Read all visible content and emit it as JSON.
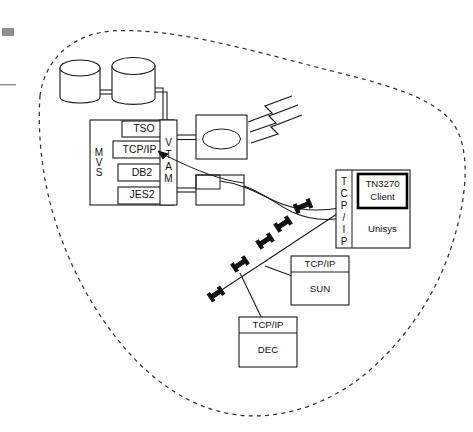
{
  "diagram": {
    "type": "network-architecture-diagram",
    "boundary": {
      "name": "enterprise-network-boundary",
      "style": "dashed-cloud"
    },
    "mainframe": {
      "os_label": "MVS",
      "access_method_label": "VTAM",
      "subsystems": [
        {
          "label": "TSO"
        },
        {
          "label": "TCP/IP"
        },
        {
          "label": "DB2"
        },
        {
          "label": "JES2"
        }
      ]
    },
    "storage": {
      "label": "",
      "count": 2
    },
    "controllers": [
      {
        "label": ""
      },
      {
        "label": ""
      }
    ],
    "hosts": [
      {
        "name": "unisys-host",
        "stack_label": "TCP/IP",
        "client_label_line1": "TN3270",
        "client_label_line2": "Client",
        "platform_label": "Unisys"
      },
      {
        "name": "sun-host",
        "stack_label": "TCP/IP",
        "platform_label": "SUN"
      },
      {
        "name": "dec-host",
        "stack_label": "TCP/IP",
        "platform_label": "DEC"
      }
    ],
    "wireless": {
      "name": "wireless-signal",
      "bolt_count": 3
    },
    "network_taps": {
      "count": 5
    },
    "colors": {
      "line": "#1a1a1a",
      "boundary": "#333333",
      "tap": "#111111",
      "background": "#ffffff",
      "artifact": "#8d8d8d"
    }
  }
}
